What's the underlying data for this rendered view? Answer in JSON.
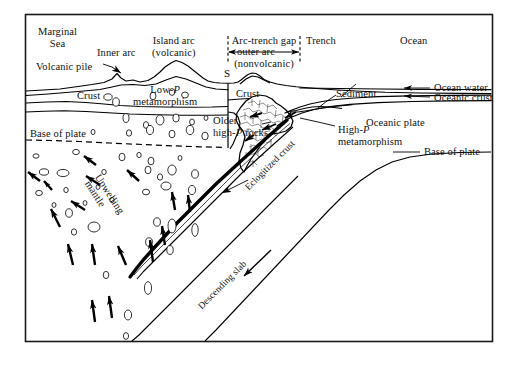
{
  "figure": {
    "type": "geologic-cross-section",
    "frame_color": "#1a1a1a",
    "line_color": "#000000",
    "text_color": "#111111",
    "background": "#ffffff"
  },
  "labels": {
    "marginal_sea_line1": "Marginal",
    "marginal_sea_line2": "Sea",
    "inner_arc": "Inner arc",
    "island_arc_line1": "Island arc",
    "island_arc_line2": "(volcanic)",
    "volcanic_pile": "Volcanic pile",
    "arc_trench_gap": "Arc-trench gap",
    "outer_arc": "outer arc",
    "nonvolcanic": "(nonvolcanic)",
    "s_marker": "S",
    "trench": "Trench",
    "ocean": "Ocean",
    "crust_left": "Crust",
    "crust_right": "Crust",
    "low_p_line1_pre": "Low-",
    "low_p_italic": "P",
    "low_p_line2": "metamorphism",
    "sediment": "Sediment",
    "ocean_water": "Ocean water",
    "oceanic_crust": "Oceanic crust",
    "oceanic_plate": "Oceanic plate",
    "older_line1": "Older",
    "older_line2_pre": "high-",
    "older_line2_italic": "P",
    "older_line2_post": " rocks",
    "high_p_line1_pre": "High-",
    "high_p_line1_italic": "P",
    "high_p_line2": "metamorphism",
    "base_of_plate_left": "Base of plate",
    "base_of_plate_right": "Base of plate",
    "upwelling_line1": "Upwelling",
    "upwelling_line2": "mantle",
    "eclogitized_crust": "Eclogitized crust",
    "descending_slab": "Descending slab"
  }
}
